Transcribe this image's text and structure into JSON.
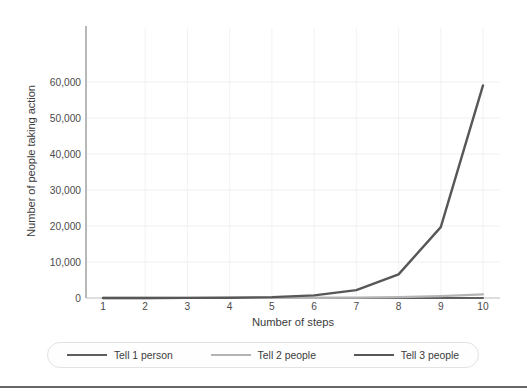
{
  "chart_data": {
    "type": "line",
    "title": "",
    "subtitle": "",
    "xlabel": "Number of steps",
    "ylabel": "Number of people taking action",
    "x": [
      1,
      2,
      3,
      4,
      5,
      6,
      7,
      8,
      9,
      10
    ],
    "xtick_labels": [
      "1",
      "2",
      "3",
      "4",
      "5",
      "6",
      "7",
      "8",
      "9",
      "10"
    ],
    "ytick_labels": [
      "0",
      "10,000",
      "20,000",
      "30,000",
      "40,000",
      "50,000",
      "60,000"
    ],
    "ytick_values": [
      0,
      10000,
      20000,
      30000,
      40000,
      50000,
      60000
    ],
    "xlim": [
      1,
      10
    ],
    "ylim": [
      0,
      60000
    ],
    "grid": "both-faint",
    "legend_position": "bottom",
    "series": [
      {
        "name": "Tell 1 person",
        "color": "#5e5e5e",
        "values": [
          1,
          2,
          3,
          4,
          5,
          6,
          7,
          8,
          9,
          10
        ]
      },
      {
        "name": "Tell 2 people",
        "color": "#b4b4b4",
        "values": [
          2,
          4,
          8,
          16,
          32,
          64,
          128,
          256,
          512,
          1024
        ]
      },
      {
        "name": "Tell 3 people",
        "color": "#575757",
        "values": [
          3,
          9,
          27,
          81,
          243,
          729,
          2187,
          6561,
          19683,
          59049
        ]
      }
    ]
  },
  "legend": {
    "items": [
      {
        "label": "Tell 1 person"
      },
      {
        "label": "Tell 2 people"
      },
      {
        "label": "Tell 3 people"
      }
    ]
  },
  "colors": {
    "series_1": "#5e5e5e",
    "series_2": "#b4b4b4",
    "series_3": "#575757",
    "axis": "#8a8a8a",
    "grid": "#f0f0f2",
    "text": "#3c3c3c",
    "footer_rule": "#666666"
  }
}
